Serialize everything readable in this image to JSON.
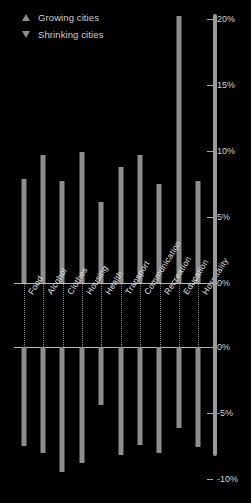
{
  "legend": {
    "items": [
      {
        "label": "Growing cities",
        "marker": "triangle-up-icon"
      },
      {
        "label": "Shrinking cities",
        "marker": "triangle-down-icon"
      }
    ]
  },
  "axis": {
    "y_ticks_top": [
      "20%",
      "15%",
      "10%",
      "5%",
      "0%"
    ],
    "y_ticks_bottom": [
      "0%",
      "-5%",
      "-10%"
    ]
  },
  "colors": {
    "background": "#000000",
    "bar": "#8d8d8d",
    "text": "#d9d9d9",
    "axis": "#b9b9b9"
  },
  "chart_data": {
    "type": "bar",
    "title": "",
    "subtitle": "",
    "xlabel": "",
    "ylabel": "",
    "grid": true,
    "legend_position": "top-left",
    "orientation": "vertical",
    "layout": "mirrored-dual-panel",
    "categories": [
      "Food",
      "Alcohol",
      "Clothes",
      "Housing",
      "Health",
      "Transport",
      "Communication",
      "Recreation",
      "Education",
      "Hospitality"
    ],
    "series": [
      {
        "name": "Growing cities",
        "panel": "top",
        "ylim": [
          0,
          21
        ],
        "yticks": [
          0,
          5,
          10,
          15,
          20
        ],
        "values": [
          7.9,
          9.7,
          7.7,
          9.9,
          6.1,
          8.8,
          9.7,
          7.5,
          20.2,
          7.7
        ]
      },
      {
        "name": "Shrinking cities",
        "panel": "bottom",
        "ylim": [
          -10.5,
          0
        ],
        "yticks": [
          0,
          -5,
          -10
        ],
        "values": [
          -7.5,
          -8.0,
          -9.5,
          -8.8,
          -4.4,
          -8.2,
          -7.4,
          -8.0,
          -6.1,
          -7.6
        ]
      }
    ]
  }
}
